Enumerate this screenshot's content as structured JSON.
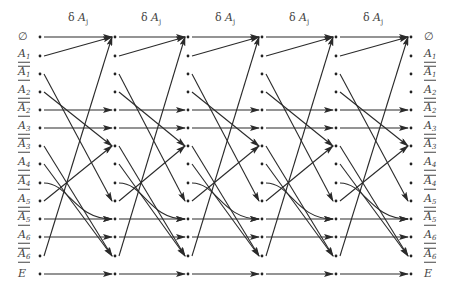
{
  "header": {
    "symbol": "δ",
    "operator": "A",
    "subscript": "j",
    "columns": [
      {
        "label": "δ A_j",
        "x": 78
      },
      {
        "label": "δ A_j",
        "x": 151
      },
      {
        "label": "δ A_j",
        "x": 225
      },
      {
        "label": "δ A_j",
        "x": 299
      },
      {
        "label": "δ A_j",
        "x": 373
      }
    ]
  },
  "rows": [
    {
      "id": "empty",
      "base": "∅",
      "sub": "",
      "bar": false,
      "underline": false,
      "y": 37
    },
    {
      "id": "A1",
      "base": "A",
      "sub": "1",
      "bar": false,
      "underline": true,
      "y": 56
    },
    {
      "id": "A1bar",
      "base": "A",
      "sub": "1",
      "bar": true,
      "underline": true,
      "y": 74
    },
    {
      "id": "A2",
      "base": "A",
      "sub": "2",
      "bar": false,
      "underline": true,
      "y": 92
    },
    {
      "id": "A2bar",
      "base": "A",
      "sub": "2",
      "bar": true,
      "underline": true,
      "y": 110
    },
    {
      "id": "A3",
      "base": "A",
      "sub": "3",
      "bar": false,
      "underline": true,
      "y": 128
    },
    {
      "id": "A3bar",
      "base": "A",
      "sub": "3",
      "bar": true,
      "underline": true,
      "y": 146
    },
    {
      "id": "A4",
      "base": "A",
      "sub": "4",
      "bar": false,
      "underline": true,
      "y": 164
    },
    {
      "id": "A4bar",
      "base": "A",
      "sub": "4",
      "bar": true,
      "underline": true,
      "y": 183
    },
    {
      "id": "A5",
      "base": "A",
      "sub": "5",
      "bar": false,
      "underline": true,
      "y": 201
    },
    {
      "id": "A5bar",
      "base": "A",
      "sub": "5",
      "bar": true,
      "underline": true,
      "y": 219
    },
    {
      "id": "A6",
      "base": "A",
      "sub": "6",
      "bar": false,
      "underline": true,
      "y": 237
    },
    {
      "id": "A6bar",
      "base": "A",
      "sub": "6",
      "bar": true,
      "underline": true,
      "y": 256
    },
    {
      "id": "E",
      "base": "E",
      "sub": "",
      "bar": false,
      "underline": false,
      "y": 274
    }
  ],
  "layers_x": [
    40,
    115,
    188,
    262,
    336,
    411
  ],
  "transitions": [
    {
      "from": 0,
      "to": 0
    },
    {
      "from": 1,
      "to": 0
    },
    {
      "from": 12,
      "to": 0
    },
    {
      "from": 2,
      "to": 9
    },
    {
      "from": 3,
      "to": 6
    },
    {
      "from": 9,
      "to": 6
    },
    {
      "from": 4,
      "to": 4
    },
    {
      "from": 5,
      "to": 5
    },
    {
      "from": 6,
      "to": 12
    },
    {
      "from": 7,
      "to": 12
    },
    {
      "from": 8,
      "to": 10
    },
    {
      "from": 10,
      "to": 10
    },
    {
      "from": 11,
      "to": 11
    },
    {
      "from": 13,
      "to": 13
    }
  ],
  "colors": {
    "line": "#2a2a2a",
    "dot": "#222222",
    "text": "#444444"
  }
}
